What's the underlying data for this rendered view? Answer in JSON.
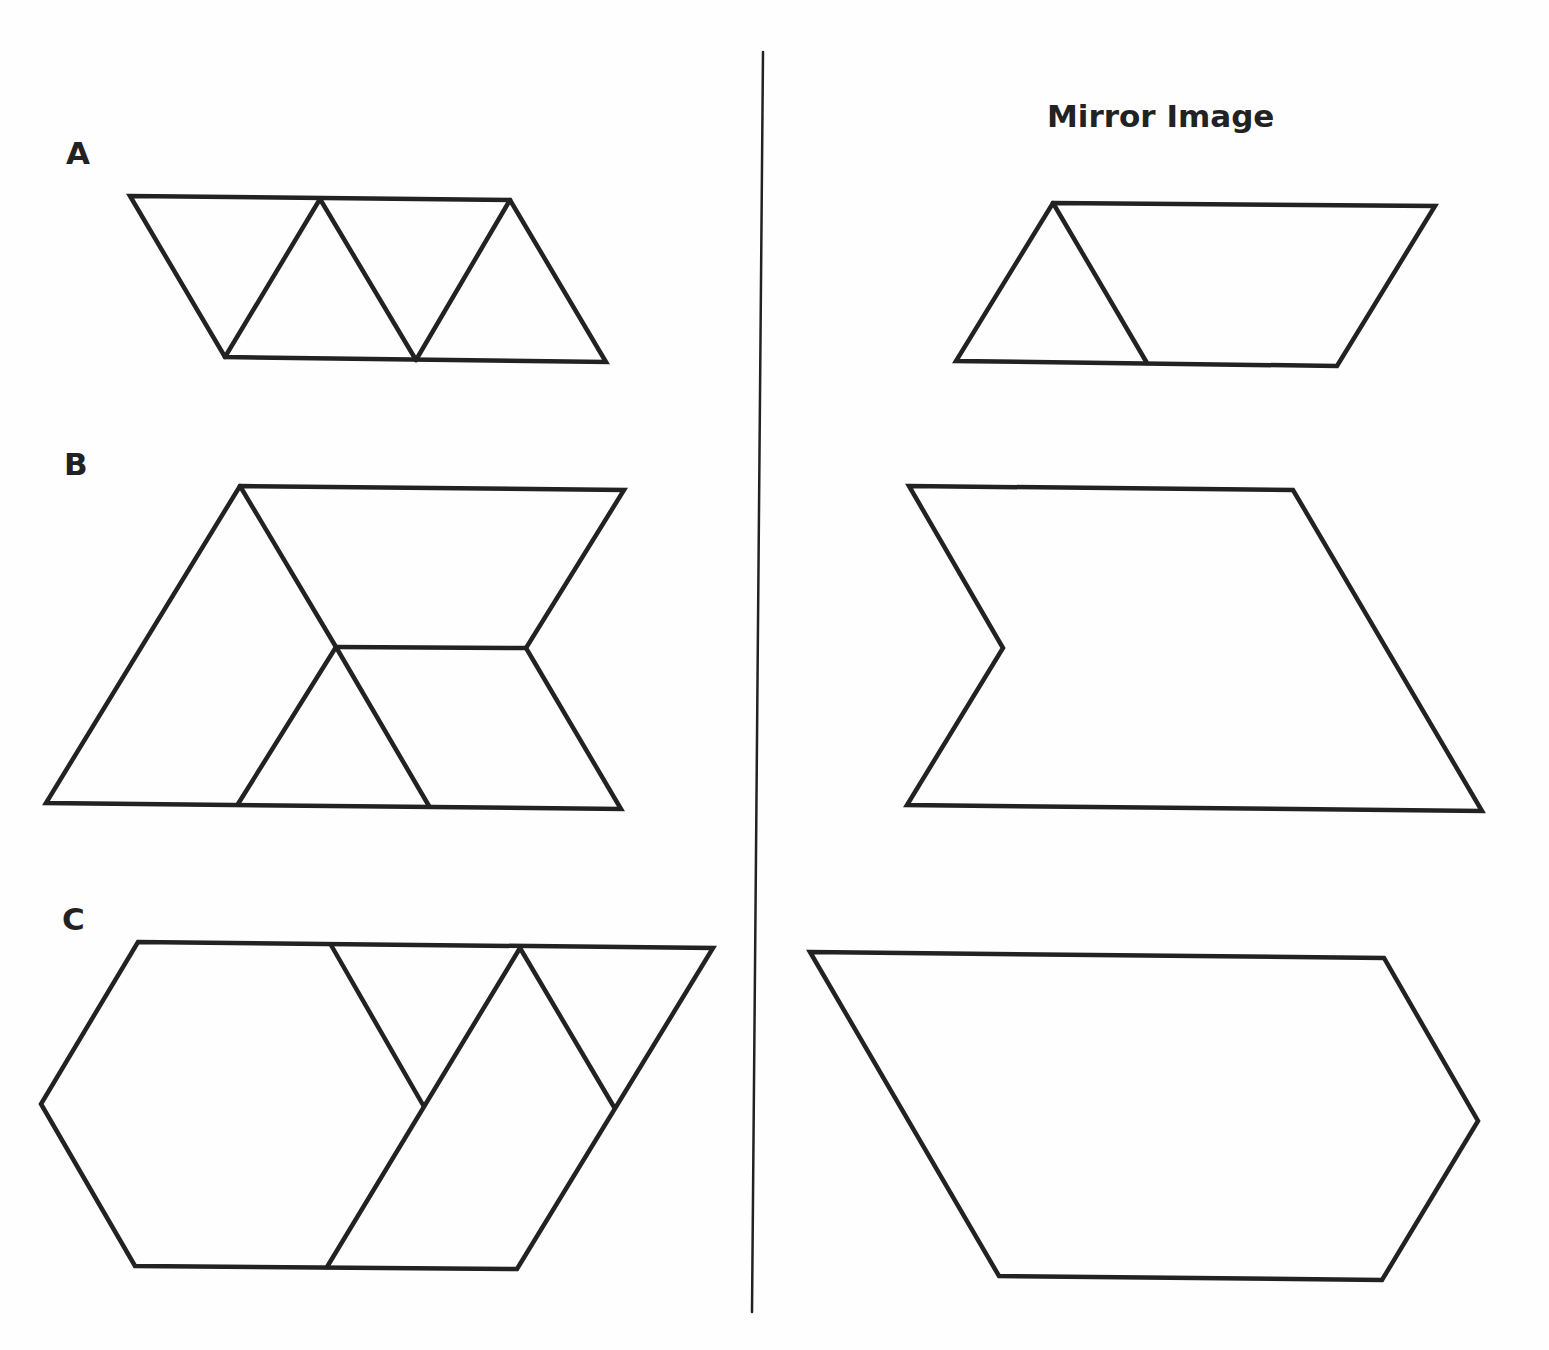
{
  "worksheet": {
    "mirror_heading": "Mirror Image",
    "colors": {
      "stroke": "#222222",
      "background": "#fefefe"
    },
    "rows": [
      {
        "label": "A",
        "original_description": "Parallelogram made of four equilateral triangles (alternating up/down)",
        "mirror_description": "Triangle plus trapezoid forming a parallelogram slanting the other way"
      },
      {
        "label": "B",
        "original_description": "Large triangle, upper trapezoid, small triangle and lower rhombus pieces",
        "mirror_description": "Outline only: notched hexagon shape (mirror of B)"
      },
      {
        "label": "C",
        "original_description": "Hexagon, two small triangles and a rhombus piece",
        "mirror_description": "Outline only: pentagon-like shape (mirror of C)"
      }
    ]
  }
}
